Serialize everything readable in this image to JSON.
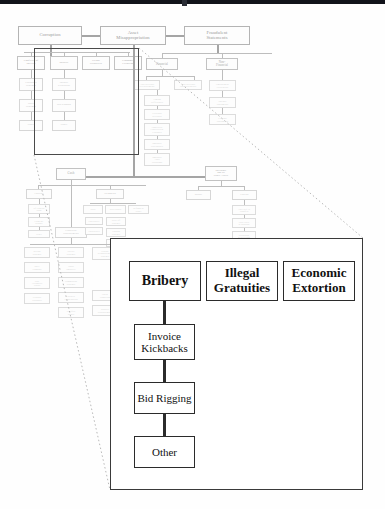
{
  "diagram": {
    "type": "hierarchical-tree",
    "accent_color": "#2b2b2b",
    "faded_color": "#c0c0c0"
  },
  "tree": {
    "level1": [
      {
        "id": "corruption",
        "label": "Corruption"
      },
      {
        "id": "asset_misapp",
        "label": "Asset\nMisappropriation"
      },
      {
        "id": "fraud_stmt",
        "label": "Fraudulent\nStatements"
      }
    ],
    "corruption_children": [
      {
        "label": "Conflicts of\nInterest"
      },
      {
        "label": "Bribery"
      },
      {
        "label": "Illegal\nGratuities"
      },
      {
        "label": "Economic\nExtortion"
      }
    ],
    "conflicts_chain": [
      {
        "label": "Purchases\nSchemes"
      },
      {
        "label": "Sales\nSchemes"
      },
      {
        "label": "Other"
      }
    ],
    "bribery_chain": [
      {
        "label": "Invoice\nKickbacks"
      },
      {
        "label": "Bid Rigging"
      },
      {
        "label": "Other"
      }
    ],
    "fraud_stmt_children": [
      {
        "label": "Financial"
      },
      {
        "label": "Non-\nFinancial"
      }
    ],
    "financial_children": [
      {
        "label": "Asset/Revenue\nOverstatements"
      },
      {
        "label": "Asset/Revenue\nUnderstatements"
      }
    ],
    "financial_chain": [
      {
        "label": "Timing\nDifferences"
      },
      {
        "label": "Fictitious\nRevenues"
      },
      {
        "label": "Concealed\nLiabilities &\nExpenses"
      },
      {
        "label": "Improper\nDisclosures"
      },
      {
        "label": "Improper\nAsset\nValuations"
      }
    ],
    "nonfinancial_chain": [
      {
        "label": "Employment\nCredentials"
      },
      {
        "label": "Internal\nDocuments"
      },
      {
        "label": "External\nDocuments"
      }
    ],
    "asset_children": [
      {
        "label": "Cash"
      },
      {
        "label": "Inventory\nand all\nOther Assets"
      }
    ],
    "cash_children": [
      {
        "label": "Larceny"
      },
      {
        "label": "Skimming"
      },
      {
        "label": "Fraudulent\nDisbursements"
      }
    ],
    "larceny_chain": [
      {
        "label": "Of Cash on\nHand"
      },
      {
        "label": "From the\nDeposit"
      },
      {
        "label": "Other"
      }
    ],
    "skimming_children": [
      {
        "label": "Sales"
      },
      {
        "label": "Receivables"
      },
      {
        "label": "Refunds &\nOther"
      }
    ],
    "sales_chain": [
      {
        "label": "Unrecorded"
      },
      {
        "label": "Understated"
      }
    ],
    "receivables_chain": [
      {
        "label": "Write-off\nSchemes"
      },
      {
        "label": "Lapping\nSchemes"
      },
      {
        "label": "Unconcealed"
      }
    ],
    "disbursements_children": [
      {
        "label": "Billing\nSchemes"
      },
      {
        "label": "Payroll\nSchemes"
      },
      {
        "label": "Expense\nReimbursement\nSchemes"
      },
      {
        "label": "Check\nTampering"
      },
      {
        "label": "Register\nDisbursements"
      }
    ],
    "billing_chain": [
      {
        "label": "Shell\nCompany"
      },
      {
        "label": "Non-\nAccomplice\nVendor"
      },
      {
        "label": "Personal\nPurchases"
      }
    ],
    "payroll_chain": [
      {
        "label": "Ghost\nEmployee"
      },
      {
        "label": "Commission\nSchemes"
      },
      {
        "label": "Workers\nCompensation"
      },
      {
        "label": "Falsified\nWages"
      }
    ],
    "expense_chain": [
      {
        "label": "Mischarac-\nterized\nExpenses"
      },
      {
        "label": "Overstated\nExpenses"
      },
      {
        "label": "Fictitious\nExpenses"
      },
      {
        "label": "Multiple\nReimburse-\nments"
      }
    ],
    "inventory_children": [
      {
        "label": "Misuse"
      },
      {
        "label": "Larceny"
      }
    ],
    "inv_larceny_chain": [
      {
        "label": "Asset Req. &\nTransfers"
      },
      {
        "label": "False Sales\n& Shipping"
      },
      {
        "label": "Purchasing\n& Receiving"
      },
      {
        "label": "Unconcealed\nLarceny"
      }
    ]
  },
  "callout": {
    "name": "magnified-corruption-branch",
    "top_row": [
      {
        "id": "bribery",
        "label": "Bribery"
      },
      {
        "id": "gratuities",
        "label": "Illegal\nGratuities"
      },
      {
        "id": "extortion",
        "label": "Economic\nExtortion"
      }
    ],
    "bribery_chain": [
      {
        "id": "invoice_kickbacks",
        "label": "Invoice\nKickbacks"
      },
      {
        "id": "bid_rigging",
        "label": "Bid Rigging"
      },
      {
        "id": "other",
        "label": "Other"
      }
    ]
  }
}
